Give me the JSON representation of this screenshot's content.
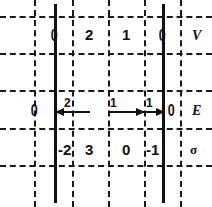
{
  "figure": {
    "width": 212,
    "height": 207,
    "ink_color": "#111111",
    "background_color": "#ffffff"
  },
  "row_labels": [
    {
      "name": "potential",
      "text": "V",
      "style": "italic"
    },
    {
      "name": "field",
      "text": "E",
      "style": "italic"
    },
    {
      "name": "charge-density",
      "text": "σ",
      "style": "greek"
    }
  ],
  "grid": {
    "vertical_dashed_x": [
      34,
      72,
      108,
      144,
      180
    ],
    "vertical_solid_x": [
      54,
      162
    ],
    "horizontal_dashed_y": [
      16,
      53,
      90,
      128,
      165
    ]
  },
  "potential_row": {
    "label": "V",
    "boundary_values": [
      "0",
      "0"
    ],
    "region_values": [
      "2",
      "1"
    ]
  },
  "field_row": {
    "label": "E",
    "boundary_values": [
      "0",
      "0"
    ],
    "arrows": [
      {
        "name": "arrow-left-2",
        "direction": "left",
        "magnitude": "2"
      },
      {
        "name": "arrow-right-1a",
        "direction": "right",
        "magnitude": "1"
      },
      {
        "name": "arrow-right-1b",
        "direction": "right",
        "magnitude": "1"
      }
    ]
  },
  "sigma_row": {
    "label": "σ",
    "values": [
      "-2",
      "3",
      "0",
      "-1"
    ]
  }
}
